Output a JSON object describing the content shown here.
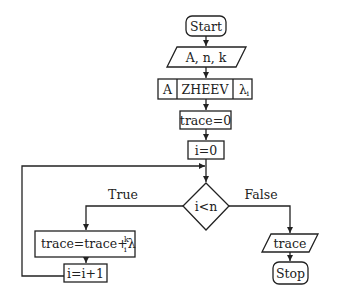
{
  "flowchart": {
    "start": "Start",
    "input": "A, n, k",
    "zheev": {
      "left": "A",
      "middle": "ZHEEV",
      "right_symbol": "λ",
      "right_sub": "i"
    },
    "init_trace": "trace=0",
    "init_i": "i=0",
    "condition": "i<n",
    "true_label": "True",
    "false_label": "False",
    "update_trace": {
      "text": "trace=trace+λ",
      "sub": "i",
      "sup": "k"
    },
    "increment": "i=i+1",
    "output": "trace",
    "stop": "Stop"
  }
}
